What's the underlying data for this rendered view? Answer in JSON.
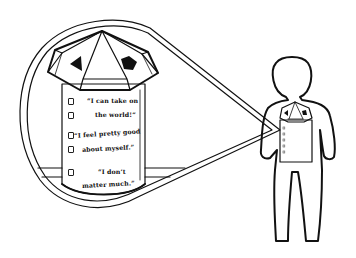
{
  "illustration": {
    "subject": "person with silo in chest, magnified in callout",
    "silo_checklist": [
      {
        "lines": [
          "“I can take on",
          "the world!”"
        ]
      },
      {
        "lines": [
          "“I feel pretty good",
          "about myself.”"
        ]
      },
      {
        "lines": [
          "“I don’t",
          "matter much.”"
        ]
      }
    ],
    "checkbox_count": 5,
    "colors": {
      "line": "#111111",
      "background": "#ffffff",
      "fill_dark": "#111111"
    }
  }
}
